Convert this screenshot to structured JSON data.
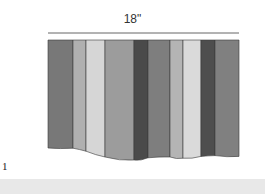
{
  "dimension_label": "18\"",
  "figure_number": "1",
  "stripes": [
    {
      "name": "stripe-1",
      "color": "#787878",
      "w": 25,
      "bottom": 0.0
    },
    {
      "name": "stripe-2",
      "color": "#b0b0b0",
      "w": 13,
      "bottom": 0.02
    },
    {
      "name": "stripe-3",
      "color": "#d6d6d6",
      "w": 19,
      "bottom": 0.3
    },
    {
      "name": "stripe-4",
      "color": "#9c9c9c",
      "w": 29,
      "bottom": 0.6
    },
    {
      "name": "stripe-5",
      "color": "#4a4a4a",
      "w": 14,
      "bottom": 0.6
    },
    {
      "name": "stripe-6",
      "color": "#7e7e7e",
      "w": 22,
      "bottom": 0.38
    },
    {
      "name": "stripe-7",
      "color": "#b4b4b4",
      "w": 13,
      "bottom": 0.52
    },
    {
      "name": "stripe-8",
      "color": "#dadada",
      "w": 18,
      "bottom": 0.5
    },
    {
      "name": "stripe-9",
      "color": "#4e4e4e",
      "w": 14,
      "bottom": 0.34
    },
    {
      "name": "stripe-10",
      "color": "#808080",
      "w": 24,
      "bottom": 0.42
    }
  ]
}
